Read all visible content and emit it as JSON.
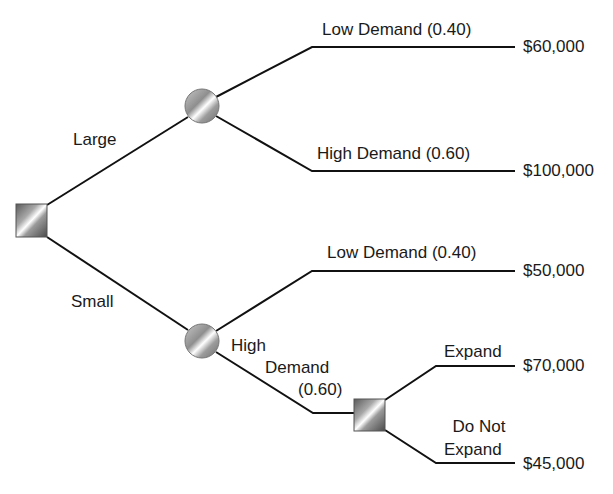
{
  "diagram": {
    "type": "decision-tree",
    "root": {
      "node_type": "decision",
      "branches": [
        {
          "label": "Large",
          "node_type": "chance",
          "outcomes": [
            {
              "label": "Low Demand (0.40)",
              "payoff": "$60,000"
            },
            {
              "label": "High Demand (0.60)",
              "payoff": "$100,000"
            }
          ]
        },
        {
          "label": "Small",
          "node_type": "chance",
          "outcomes": [
            {
              "label": "Low Demand (0.40)",
              "payoff": "$50,000"
            },
            {
              "label_lines": [
                "High",
                "Demand",
                "(0.60)"
              ],
              "node_type": "decision",
              "options": [
                {
                  "label": "Expand",
                  "payoff": "$70,000"
                },
                {
                  "label_lines": [
                    "Do Not",
                    "Expand"
                  ],
                  "payoff": "$45,000"
                }
              ]
            }
          ]
        }
      ]
    }
  }
}
